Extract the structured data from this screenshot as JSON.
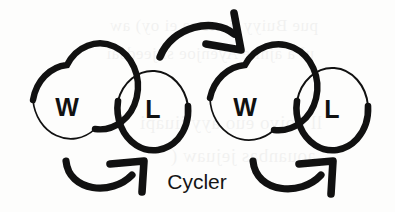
{
  "figure": {
    "caption_label": "Cycler",
    "background_color": "#fdfdfc",
    "ink_color": "#111111",
    "nodes": [
      {
        "id": "node-1",
        "label": "W",
        "cx": 67,
        "cy": 108,
        "rx": 38,
        "ry": 43
      },
      {
        "id": "node-2",
        "label": "L",
        "cx": 153,
        "cy": 110,
        "rx": 36,
        "ry": 42
      },
      {
        "id": "node-3",
        "label": "W",
        "cx": 245,
        "cy": 108,
        "rx": 39,
        "ry": 43
      },
      {
        "id": "node-4",
        "label": "L",
        "cx": 332,
        "cy": 110,
        "rx": 36,
        "ry": 42
      }
    ],
    "arrows": [
      {
        "id": "arrow-top",
        "from": "node-2",
        "to": "node-3",
        "direction": "right",
        "position": "above"
      },
      {
        "id": "arrow-bottom-left",
        "from": "node-1",
        "to": "node-2",
        "direction": "right",
        "position": "below"
      },
      {
        "id": "arrow-bottom-right",
        "from": "node-3",
        "to": "node-4",
        "direction": "right",
        "position": "below"
      }
    ],
    "ghost_text": [
      {
        "text": "pue Buiyy ji ate sa ei oy) aw",
        "x": 18,
        "y": 16,
        "size": 17
      },
      {
        "text": "ul a ajni e Ayenjoe si jeedsai",
        "x": 14,
        "y": 44,
        "size": 17
      },
      {
        "text": "ll uoiyo euo ayy jiuapi",
        "x": 22,
        "y": 112,
        "size": 19
      },
      {
        "text": "aouanbas jejuaw (",
        "x": 16,
        "y": 145,
        "size": 19
      }
    ]
  }
}
